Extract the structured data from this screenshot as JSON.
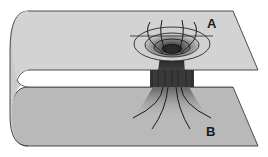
{
  "diagram": {
    "labels": {
      "a": "A",
      "b": "B"
    },
    "colors": {
      "sheet_top": "#d2d2d2",
      "sheet_bottom": "#b8b8b8",
      "outline": "#3a3a3a",
      "funnel_dark": "#2a2a2a",
      "funnel_light": "#bdbdbd",
      "background": "#ffffff"
    }
  }
}
